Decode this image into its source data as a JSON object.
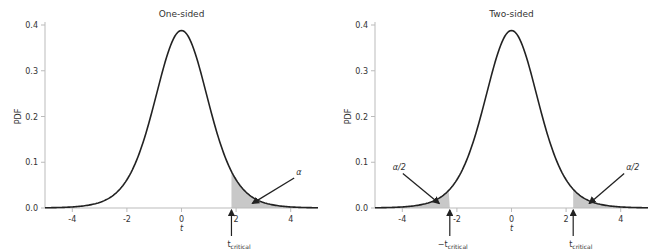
{
  "chart_data": [
    {
      "type": "line",
      "title": "One-sided",
      "xlabel": "t",
      "ylabel": "PDF",
      "xlim": [
        -5,
        5
      ],
      "ylim": [
        0,
        0.4
      ],
      "xticks": [
        "-4",
        "-2",
        "0",
        "2",
        "4"
      ],
      "yticks": [
        "0.0",
        "0.1",
        "0.2",
        "0.3",
        "0.4"
      ],
      "series": [
        {
          "name": "t-distribution PDF (df=9)",
          "df": 9
        }
      ],
      "shaded_regions": [
        {
          "from": 1.83,
          "to": 5,
          "label": "α"
        }
      ],
      "annotations": [
        {
          "text": "α",
          "arrow_to": [
            2.6,
            0.01
          ],
          "text_at": [
            4.2,
            0.07
          ]
        },
        {
          "text": "t",
          "sub": "critical",
          "x": 1.83
        }
      ],
      "grid": false
    },
    {
      "type": "line",
      "title": "Two-sided",
      "xlabel": "t",
      "ylabel": "PDF",
      "xlim": [
        -5,
        5
      ],
      "ylim": [
        0,
        0.4
      ],
      "xticks": [
        "-4",
        "-2",
        "0",
        "2",
        "4"
      ],
      "yticks": [
        "0.0",
        "0.1",
        "0.2",
        "0.3",
        "0.4"
      ],
      "series": [
        {
          "name": "t-distribution PDF (df=9)",
          "df": 9
        }
      ],
      "shaded_regions": [
        {
          "from": -5,
          "to": -2.26,
          "label": "α/2"
        },
        {
          "from": 2.26,
          "to": 5,
          "label": "α/2"
        }
      ],
      "annotations": [
        {
          "text": "α/2",
          "arrow_to": [
            -2.65,
            0.01
          ],
          "text_at": [
            -4.2,
            0.08
          ]
        },
        {
          "text": "α/2",
          "arrow_to": [
            2.85,
            0.01
          ],
          "text_at": [
            4.2,
            0.08
          ]
        },
        {
          "text": "−t",
          "sub": "critical",
          "x": -2.26
        },
        {
          "text": "t",
          "sub": "critical",
          "x": 2.26
        }
      ],
      "grid": false
    }
  ],
  "labels": {
    "title_left": "One-sided",
    "title_right": "Two-sided",
    "ylabel": "PDF",
    "xlabel": "t",
    "alpha": "α",
    "alpha_half": "α/2",
    "tcrit_main": "t",
    "tcrit_neg_main": "−t",
    "tcrit_sub": "critical"
  }
}
